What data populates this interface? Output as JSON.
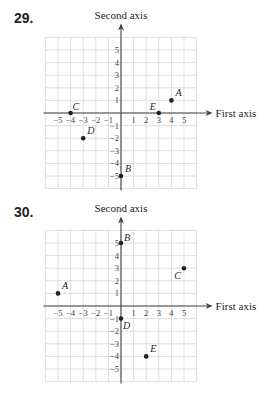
{
  "problems": [
    {
      "number": "29.",
      "top": 0
    },
    {
      "number": "30.",
      "top": 195
    }
  ],
  "chart_data": [
    {
      "type": "scatter",
      "title": "29.",
      "xlabel": "First axis",
      "ylabel": "Second axis",
      "xlim": [
        -6,
        6
      ],
      "ylim": [
        -6,
        6
      ],
      "grid": true,
      "xticks": [
        -5,
        -4,
        -3,
        -2,
        -1,
        1,
        2,
        3,
        4,
        5
      ],
      "yticks": [
        -5,
        -4,
        -3,
        -2,
        -1,
        1,
        2,
        3,
        4,
        5
      ],
      "points": [
        {
          "label": "A",
          "x": 4,
          "y": 1
        },
        {
          "label": "B",
          "x": 0,
          "y": -5
        },
        {
          "label": "C",
          "x": -4,
          "y": 0
        },
        {
          "label": "D",
          "x": -3,
          "y": -2
        },
        {
          "label": "E",
          "x": 3,
          "y": 0
        }
      ]
    },
    {
      "type": "scatter",
      "title": "30.",
      "xlabel": "First axis",
      "ylabel": "Second axis",
      "xlim": [
        -6,
        6
      ],
      "ylim": [
        -6,
        6
      ],
      "grid": true,
      "xticks": [
        -5,
        -4,
        -3,
        -2,
        -1,
        1,
        2,
        3,
        4,
        5
      ],
      "yticks": [
        -5,
        -4,
        -3,
        -2,
        -1,
        1,
        2,
        3,
        4,
        5
      ],
      "points": [
        {
          "label": "A",
          "x": -5,
          "y": 1
        },
        {
          "label": "B",
          "x": 0,
          "y": 5
        },
        {
          "label": "C",
          "x": 5,
          "y": 3
        },
        {
          "label": "D",
          "x": 0,
          "y": -1
        },
        {
          "label": "E",
          "x": 2,
          "y": -4
        }
      ]
    }
  ]
}
